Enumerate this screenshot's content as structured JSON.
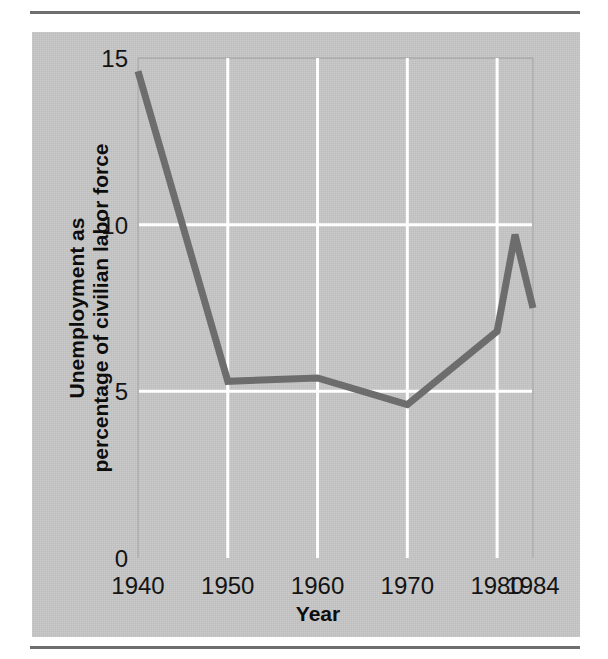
{
  "figure": {
    "panel_color": "#c7c7c7",
    "rule_color": "#6e6e6e",
    "line_color": "#6d6d6d",
    "gridline_color": "#ffffff",
    "text_color": "#141414"
  },
  "chart_data": {
    "type": "line",
    "title": "",
    "xlabel": "Year",
    "ylabel_line1": "Unemployment as",
    "ylabel_line2": "percentage of civilian labor force",
    "xlim": [
      1940,
      1984
    ],
    "ylim": [
      0,
      15
    ],
    "grid": true,
    "legend": "none",
    "xticks": [
      1940,
      1950,
      1960,
      1970,
      1980,
      1984
    ],
    "xtick_labels": [
      "1940",
      "1950",
      "1960",
      "1970",
      "1980",
      "1984"
    ],
    "yticks": [
      0,
      5,
      10,
      15
    ],
    "ytick_labels": [
      "0",
      "5",
      "10",
      "15"
    ],
    "x": [
      1940,
      1950,
      1960,
      1970,
      1980,
      1982,
      1984
    ],
    "values": [
      14.6,
      5.3,
      5.4,
      4.6,
      6.8,
      9.7,
      7.5
    ],
    "series": [
      {
        "name": "Unemployment rate",
        "values": [
          14.6,
          5.3,
          5.4,
          4.6,
          6.8,
          9.7,
          7.5
        ]
      }
    ]
  }
}
